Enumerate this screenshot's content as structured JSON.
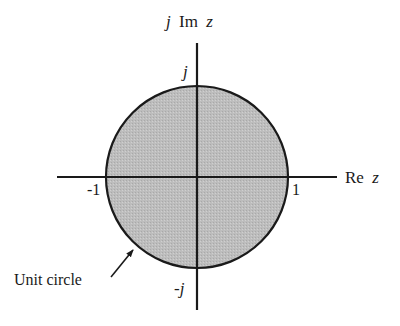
{
  "diagram": {
    "axes": {
      "imag_label_prefix": "j",
      "imag_label_im": "Im",
      "imag_label_var": "z",
      "real_label_re": "Re",
      "real_label_var": "z"
    },
    "ticks": {
      "top": "j",
      "bottom": "-j",
      "left": "-1",
      "right": "1"
    },
    "annotation": {
      "label": "Unit circle"
    },
    "colors": {
      "fill": "#b8b8b8",
      "stroke": "#1a1a1a",
      "background": "#ffffff"
    },
    "geometry": {
      "center_x": 197,
      "center_y": 177,
      "radius": 91
    }
  }
}
